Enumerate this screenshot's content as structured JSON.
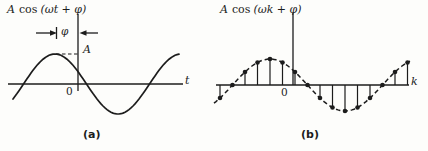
{
  "figure": {
    "ink_color": "#1c1c1c",
    "background_color": "#fdfdfb"
  },
  "panel_a": {
    "title": {
      "amplitude": "A",
      "function": "cos",
      "argument": "(ωt + φ)"
    },
    "phase_label": "φ",
    "amplitude_label": "A",
    "origin_label": "0",
    "axis_label": "t",
    "caption": "(a)"
  },
  "panel_b": {
    "title": {
      "amplitude": "A",
      "function": "cos",
      "argument": "(ωk + φ)"
    },
    "origin_label": "0",
    "axis_label": "k",
    "caption": "(b)"
  },
  "chart_data": [
    {
      "type": "line",
      "panel": "a",
      "title": "A cos (ωt + φ)",
      "xlabel": "t",
      "amplitude_norm": 1,
      "phase_periods_before_origin": 0.183,
      "x_range_periods": [
        -0.333,
        0.992
      ],
      "annotations": [
        "phase offset φ between peak and vertical axis",
        "dashed amplitude level A at peak"
      ]
    },
    {
      "type": "stem",
      "panel": "b",
      "title": "A cos (ωk + φ)",
      "xlabel": "k",
      "samples_per_period": 12,
      "envelope": "dashed cosine",
      "samples": [
        {
          "n": 0,
          "value": -0.5
        },
        {
          "n": 1,
          "value": 0
        },
        {
          "n": 2,
          "value": 0.5
        },
        {
          "n": 3,
          "value": 0.866
        },
        {
          "n": 4,
          "value": 1
        },
        {
          "n": 5,
          "value": 0.866
        },
        {
          "n": 6,
          "value": 0.5
        },
        {
          "n": 7,
          "value": 0
        },
        {
          "n": 8,
          "value": -0.5
        },
        {
          "n": 9,
          "value": -0.866
        },
        {
          "n": 10,
          "value": -1
        },
        {
          "n": 11,
          "value": -0.866
        },
        {
          "n": 12,
          "value": -0.5
        },
        {
          "n": 13,
          "value": 0
        },
        {
          "n": 14,
          "value": 0.5
        },
        {
          "n": 15,
          "value": 0.866
        }
      ]
    }
  ]
}
